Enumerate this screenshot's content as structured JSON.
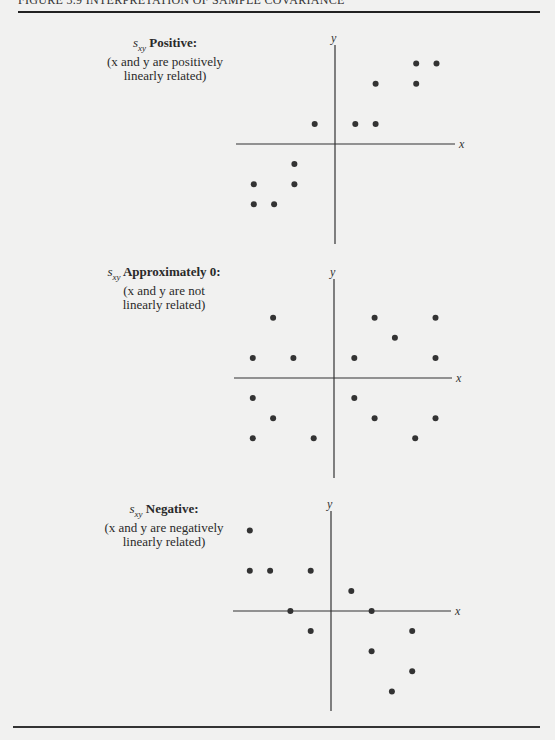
{
  "figure": {
    "header": "FIGURE 3.9   INTERPRETATION OF SAMPLE COVARIANCE"
  },
  "panels": [
    {
      "statistic": "s",
      "subscript": "xy",
      "title": "Positive:",
      "desc_line1": "(x and y are positively",
      "desc_line2": "linearly related)"
    },
    {
      "statistic": "s",
      "subscript": "xy",
      "title": "Approximately 0:",
      "desc_line1": "(x and y are not",
      "desc_line2": "linearly related)"
    },
    {
      "statistic": "s",
      "subscript": "xy",
      "title": "Negative:",
      "desc_line1": "(x and y are negatively",
      "desc_line2": "linearly related)"
    }
  ],
  "chart_data": [
    {
      "type": "scatter",
      "title": "s_xy Positive: (x and y are positively linearly related)",
      "xlabel": "x",
      "ylabel": "y",
      "grid": false,
      "axes": "centered at origin, no ticks",
      "points": [
        {
          "x": 4,
          "y": 4
        },
        {
          "x": 5,
          "y": 4
        },
        {
          "x": 2,
          "y": 3
        },
        {
          "x": 4,
          "y": 3
        },
        {
          "x": -1,
          "y": 1
        },
        {
          "x": 1,
          "y": 1
        },
        {
          "x": 2,
          "y": 1
        },
        {
          "x": -2,
          "y": -1
        },
        {
          "x": -4,
          "y": -2
        },
        {
          "x": -2,
          "y": -2
        },
        {
          "x": -4,
          "y": -3
        },
        {
          "x": -3,
          "y": -3
        }
      ]
    },
    {
      "type": "scatter",
      "title": "s_xy Approximately 0: (x and y are not linearly related)",
      "xlabel": "x",
      "ylabel": "y",
      "grid": false,
      "axes": "centered at origin, no ticks",
      "points": [
        {
          "x": -3,
          "y": 3
        },
        {
          "x": 2,
          "y": 3
        },
        {
          "x": 5,
          "y": 3
        },
        {
          "x": 3,
          "y": 2
        },
        {
          "x": -4,
          "y": 1
        },
        {
          "x": -2,
          "y": 1
        },
        {
          "x": 1,
          "y": 1
        },
        {
          "x": 5,
          "y": 1
        },
        {
          "x": -4,
          "y": -1
        },
        {
          "x": 1,
          "y": -1
        },
        {
          "x": -3,
          "y": -2
        },
        {
          "x": 2,
          "y": -2
        },
        {
          "x": 5,
          "y": -2
        },
        {
          "x": -4,
          "y": -3
        },
        {
          "x": -1,
          "y": -3
        },
        {
          "x": 4,
          "y": -3
        }
      ]
    },
    {
      "type": "scatter",
      "title": "s_xy Negative: (x and y are negatively linearly related)",
      "xlabel": "x",
      "ylabel": "y",
      "grid": false,
      "axes": "centered at origin, no ticks",
      "points": [
        {
          "x": -4,
          "y": 4
        },
        {
          "x": -4,
          "y": 2
        },
        {
          "x": -3,
          "y": 2
        },
        {
          "x": -1,
          "y": 2
        },
        {
          "x": 1,
          "y": 1
        },
        {
          "x": -2,
          "y": 0
        },
        {
          "x": 2,
          "y": 0
        },
        {
          "x": -1,
          "y": -1
        },
        {
          "x": 4,
          "y": -1
        },
        {
          "x": 2,
          "y": -2
        },
        {
          "x": 4,
          "y": -3
        },
        {
          "x": 3,
          "y": -4
        }
      ]
    }
  ],
  "colors": {
    "background": "#f1f1f0",
    "ink": "#2a2a2a",
    "points": "#333333"
  }
}
